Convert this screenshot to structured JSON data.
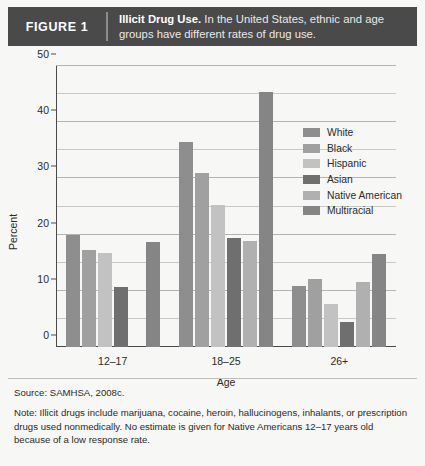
{
  "header": {
    "figure_number": "FIGURE 1",
    "caption_title": "Illicit Drug Use.",
    "caption_text": " In the United States, ethnic and age groups have different rates of drug use."
  },
  "footnotes": {
    "source": "Source: SAMHSA, 2008c.",
    "note": "Note: Illicit drugs include marijuana, cocaine, heroin, hallucinogens, inhalants, or prescription drugs used nonmedically. No estimate is given for Native Americans 12–17 years old because of a low response rate."
  },
  "colors": {
    "header_bg": "#4a4a4a",
    "page_bg": "#f7f7f5",
    "axis": "#4a4a4a",
    "grid": "#c9c9c4",
    "white_series": "#8e8e8e",
    "black_series": "#a0a0a0",
    "hispanic_series": "#c2c2c2",
    "asian_series": "#6f6f6f",
    "native_american_series": "#b0b0b0",
    "multiracial_series": "#858585"
  },
  "chart_data": {
    "type": "bar",
    "title": "Illicit Drug Use",
    "xlabel": "Age",
    "ylabel": "Percent",
    "ylim": [
      0,
      50
    ],
    "yticks": [
      0,
      10,
      20,
      30,
      40,
      50
    ],
    "ytick_labels": [
      "0",
      "10",
      "20",
      "30",
      "40",
      "50"
    ],
    "gridlines_minor": [
      5,
      15,
      25,
      35,
      45
    ],
    "grid": true,
    "legend_position": "top-right",
    "categories": [
      "12–17",
      "18–25",
      "26+"
    ],
    "series": [
      {
        "name": "White",
        "color": "#8e8e8e",
        "values": [
          20.0,
          36.5,
          10.8
        ]
      },
      {
        "name": "Black",
        "color": "#a0a0a0",
        "values": [
          17.3,
          31.0,
          12.1
        ]
      },
      {
        "name": "Hispanic",
        "color": "#c2c2c2",
        "values": [
          16.8,
          25.3,
          7.6
        ]
      },
      {
        "name": "Asian",
        "color": "#6f6f6f",
        "values": [
          10.7,
          19.4,
          4.4
        ]
      },
      {
        "name": "Native American",
        "color": "#b0b0b0",
        "values": [
          null,
          18.8,
          11.5
        ]
      },
      {
        "name": "Multiracial",
        "color": "#858585",
        "values": [
          18.6,
          45.3,
          16.6
        ]
      }
    ]
  }
}
